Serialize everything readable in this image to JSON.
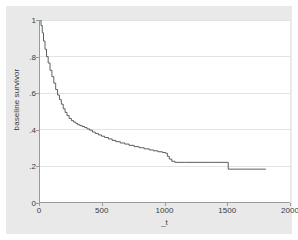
{
  "chart_data": {
    "type": "line",
    "subtype": "step-function",
    "title": "",
    "xlabel": "_t",
    "ylabel": "baseline survivor",
    "xlim": [
      0,
      2000
    ],
    "ylim": [
      0,
      1
    ],
    "xticks": [
      0,
      500,
      1000,
      1500,
      2000
    ],
    "xtick_labels": [
      "0",
      "500",
      "1000",
      "1500",
      "2000"
    ],
    "yticks": [
      0,
      0.2,
      0.4,
      0.6,
      0.8,
      1
    ],
    "ytick_labels": [
      "0",
      ".2",
      ".4",
      ".6",
      ".8",
      "1"
    ],
    "grid": "horizontal",
    "legend": "none",
    "line_color": "#4d4d4d",
    "plot_background": "#ffffff",
    "graph_background": "#e9e9e9",
    "grid_color": "#e3e3e3",
    "axis_color": "#9a9a9a",
    "series": [
      {
        "name": "baseline survivor",
        "step": "post",
        "x": [
          0,
          8,
          18,
          28,
          40,
          52,
          65,
          80,
          95,
          110,
          125,
          140,
          155,
          170,
          185,
          200,
          215,
          232,
          250,
          268,
          285,
          300,
          318,
          336,
          355,
          375,
          395,
          418,
          440,
          465,
          490,
          515,
          545,
          575,
          605,
          640,
          675,
          710,
          750,
          790,
          830,
          870,
          905,
          940,
          975,
          1000,
          1015,
          1030,
          1050,
          1075,
          1150,
          1250,
          1380,
          1500,
          1650,
          1800
        ],
        "y": [
          1.0,
          0.97,
          0.93,
          0.885,
          0.84,
          0.8,
          0.765,
          0.725,
          0.69,
          0.655,
          0.62,
          0.59,
          0.565,
          0.54,
          0.515,
          0.495,
          0.478,
          0.462,
          0.45,
          0.442,
          0.435,
          0.428,
          0.423,
          0.418,
          0.412,
          0.405,
          0.398,
          0.388,
          0.38,
          0.372,
          0.365,
          0.358,
          0.35,
          0.342,
          0.335,
          0.328,
          0.322,
          0.315,
          0.308,
          0.302,
          0.296,
          0.29,
          0.285,
          0.28,
          0.276,
          0.272,
          0.255,
          0.24,
          0.228,
          0.222,
          0.222,
          0.222,
          0.222,
          0.185,
          0.185,
          0.185
        ]
      }
    ]
  },
  "axes": {
    "ylabel_text": "baseline survivor",
    "xlabel_text": "_t",
    "ytick_0": "0",
    "ytick_1": ".2",
    "ytick_2": ".4",
    "ytick_3": ".6",
    "ytick_4": ".8",
    "ytick_5": "1",
    "xtick_0": "0",
    "xtick_1": "500",
    "xtick_2": "1000",
    "xtick_3": "1500",
    "xtick_4": "2000"
  }
}
